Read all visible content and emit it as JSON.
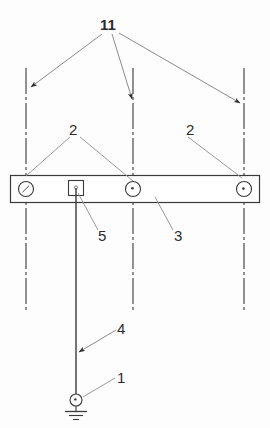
{
  "figure": {
    "type": "technical-line-drawing",
    "title": "",
    "background_color": "#fdfdfd",
    "line_color": "#3a3a3a",
    "leader_color": "#8a8a8a",
    "label_color": "#2b2b2b",
    "canvas": {
      "width": 270,
      "height": 428
    }
  },
  "reference_labels": [
    {
      "id": "label-11",
      "text": "11",
      "x": 106,
      "y": 25,
      "describes": "overhead-phase-conductors"
    },
    {
      "id": "label-2-left",
      "text": "2",
      "x": 73,
      "y": 130,
      "describes": "bushing-insulator"
    },
    {
      "id": "label-2-right",
      "text": "2",
      "x": 190,
      "y": 130,
      "describes": "bushing-insulator"
    },
    {
      "id": "label-5",
      "text": "5",
      "x": 101,
      "y": 237,
      "describes": "connection-terminal-box"
    },
    {
      "id": "label-3",
      "text": "3",
      "x": 178,
      "y": 237,
      "describes": "support-beam-enclosure"
    },
    {
      "id": "label-4",
      "text": "4",
      "x": 120,
      "y": 334,
      "describes": "down-conductor"
    },
    {
      "id": "label-1",
      "text": "1",
      "x": 120,
      "y": 384,
      "describes": "earth-ground-electrode"
    }
  ],
  "beam": {
    "name": "horizontal-enclosure",
    "x": 10,
    "y": 175,
    "width": 250,
    "height": 28
  },
  "bushings": [
    {
      "name": "bushing-left",
      "cx": 26,
      "cy": 189,
      "r": 8
    },
    {
      "name": "bushing-center",
      "cx": 133,
      "cy": 189,
      "r": 8
    },
    {
      "name": "bushing-right",
      "cx": 244,
      "cy": 189,
      "r": 8
    }
  ],
  "terminal_box": {
    "name": "terminal-box",
    "x": 68,
    "y": 180,
    "width": 16,
    "height": 16
  },
  "center_lines": [
    {
      "name": "centerline-left",
      "x": 26,
      "y1": 68,
      "y2": 310
    },
    {
      "name": "centerline-center",
      "x": 133,
      "y1": 68,
      "y2": 310
    },
    {
      "name": "centerline-right",
      "x": 244,
      "y1": 68,
      "y2": 310
    }
  ],
  "down_conductor": {
    "name": "down-conductor",
    "x": 76,
    "y1": 188,
    "y2": 400
  },
  "ground_electrode": {
    "name": "ground-electrode",
    "cx": 76,
    "cy": 400,
    "r": 6,
    "bar_widths": [
      20,
      12,
      5
    ],
    "bar_ys": [
      412,
      416,
      420
    ]
  },
  "leaders": [
    {
      "name": "leader-11-to-left",
      "from": [
        102,
        33
      ],
      "to": [
        30,
        88
      ],
      "arrow": true
    },
    {
      "name": "leader-11-to-center",
      "from": [
        112,
        33
      ],
      "to": [
        133,
        100
      ],
      "arrow": true
    },
    {
      "name": "leader-11-to-right",
      "from": [
        118,
        32
      ],
      "to": [
        240,
        104
      ],
      "arrow": true
    },
    {
      "name": "leader-2-left-a",
      "from": [
        70,
        136
      ],
      "to": [
        26,
        176
      ],
      "arrow": false
    },
    {
      "name": "leader-2-left-b",
      "from": [
        80,
        136
      ],
      "to": [
        133,
        180
      ],
      "arrow": false
    },
    {
      "name": "leader-2-right",
      "from": [
        188,
        136
      ],
      "to": [
        243,
        177
      ],
      "arrow": false
    },
    {
      "name": "leader-5",
      "from": [
        98,
        231
      ],
      "to": [
        78,
        192
      ],
      "arrow": false
    },
    {
      "name": "leader-3",
      "from": [
        173,
        231
      ],
      "to": [
        155,
        198
      ],
      "arrow": false
    },
    {
      "name": "leader-4",
      "from": [
        116,
        330
      ],
      "to": [
        78,
        352
      ],
      "arrow": true
    },
    {
      "name": "leader-1",
      "from": [
        115,
        378
      ],
      "to": [
        82,
        398
      ],
      "arrow": false
    }
  ]
}
